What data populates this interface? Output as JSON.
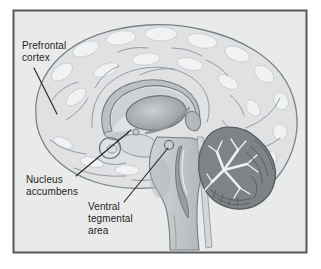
{
  "figure": {
    "labels": {
      "prefrontal_cortex": "Prefrontal\ncortex",
      "nucleus_accumbens": "Nucleus\naccumbens",
      "ventral_tegmental_area": "Ventral\ntegmental\narea"
    },
    "colors": {
      "panel_background": "#e9eaea",
      "frame_border": "#55585a",
      "cortex": "#dfe1e3",
      "gyri_highlight": "#f2f4f5",
      "corpus_callosum": "#bcc0c3",
      "thalamus": "#9aa0a4",
      "brainstem": "#c3c7ca",
      "cerebellum": "#7e8387",
      "label_text": "#1f1f1f",
      "leader_line": "#242424"
    }
  }
}
